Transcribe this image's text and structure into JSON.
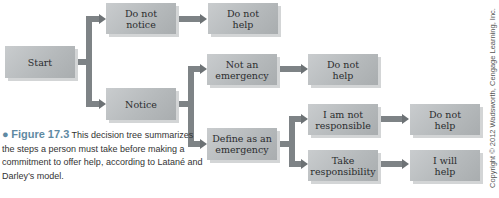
{
  "diagram": {
    "nodes": {
      "start": "Start",
      "do_not_notice": "Do not\nnotice",
      "do_not_help_1": "Do not\nhelp",
      "notice": "Notice",
      "not_an_emergency": "Not an\nemergency",
      "do_not_help_2": "Do not\nhelp",
      "define_as_emergency": "Define as an\nemergency",
      "i_am_not_responsible": "I am not\nresponsible",
      "do_not_help_3": "Do not\nhelp",
      "take_responsibility": "Take\nresponsibility",
      "i_will_help": "I will\nhelp"
    },
    "edges": [
      [
        "Start",
        "Do not notice"
      ],
      [
        "Start",
        "Notice"
      ],
      [
        "Do not notice",
        "Do not help"
      ],
      [
        "Notice",
        "Not an emergency"
      ],
      [
        "Notice",
        "Define as an emergency"
      ],
      [
        "Not an emergency",
        "Do not help"
      ],
      [
        "Define as an emergency",
        "I am not responsible"
      ],
      [
        "Define as an emergency",
        "Take responsibility"
      ],
      [
        "I am not responsible",
        "Do not help"
      ],
      [
        "Take responsibility",
        "I will help"
      ]
    ]
  },
  "caption": {
    "bullet": "●",
    "label": "Figure 17.3",
    "text": "This decision tree summarizes the steps a person must take before making a commitment to offer help, according to Latané and Darley’s model."
  },
  "copyright": "Copyright © 2012 Wadsworth, Cengage Learning, Inc.",
  "colors": {
    "box": "#b8bcbe",
    "connector": "#7e8386",
    "figure_label": "#5f8aa3"
  }
}
